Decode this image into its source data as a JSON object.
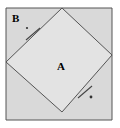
{
  "figure": {
    "labels": {
      "region_a": "A",
      "region_b": "B"
    },
    "colors": {
      "outer_square_fill": "#d9d9d9",
      "inner_square_fill": "#e3e3e3",
      "stroke": "#555555",
      "tick_stroke": "#444444",
      "background": "#ffffff",
      "label_color": "#000000"
    },
    "geometry": {
      "outer_square": {
        "name": "outer-square",
        "points": "6,8 112,8 112,120 6,120"
      },
      "inner_square": {
        "name": "inner-square-a",
        "points": "62,8 112,55 62,112 6,62"
      },
      "corner_triangle_b": {
        "name": "corner-triangle-b",
        "points": "6,8 62,8 6,62"
      },
      "tick_marks": [
        {
          "name": "tick-mark-upper-left",
          "x1": 26,
          "y1": 40,
          "x2": 40,
          "y2": 28
        },
        {
          "name": "tick-mark-lower-right",
          "x1": 78,
          "y1": 98,
          "x2": 92,
          "y2": 86
        }
      ],
      "tick_dots": [
        {
          "name": "tick-dot-upper-left",
          "cx": 27,
          "cy": 28,
          "r": 1.1
        },
        {
          "name": "tick-dot-lower-right",
          "cx": 91,
          "cy": 97,
          "r": 1.4
        }
      ]
    }
  }
}
